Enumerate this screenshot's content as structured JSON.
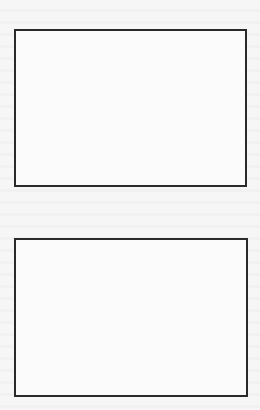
{
  "document": {
    "type": "scanned-page",
    "background_color": "#f6f6f6",
    "border_color": "#2a2a2a",
    "frames": [
      {
        "id": "frame-1",
        "content": "",
        "x": 14,
        "y": 29,
        "width": 233,
        "height": 158
      },
      {
        "id": "frame-2",
        "content": "",
        "x": 14,
        "y": 238,
        "width": 234,
        "height": 159
      }
    ]
  }
}
